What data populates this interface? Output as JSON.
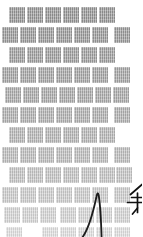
{
  "scene": {
    "description": "Scanned page fragment: fading halftone grid of gray squares, hand-drawn narrow peak curve, partial CJK character cut off at right edge",
    "background_color": "#ffffff"
  },
  "grid": {
    "square_size": 16,
    "row_pitch": 20,
    "rows": [
      {
        "y": 7,
        "shade": "#959595",
        "squares": [
          9,
          27,
          45,
          63,
          81,
          99
        ]
      },
      {
        "y": 27,
        "shade": "#999999",
        "squares": [
          2,
          20,
          38,
          56,
          74,
          92,
          114
        ]
      },
      {
        "y": 47,
        "shade": "#9e9e9e",
        "squares": [
          9,
          27,
          45,
          63,
          81,
          99
        ]
      },
      {
        "y": 67,
        "shade": "#a4a4a4",
        "squares": [
          2,
          20,
          38,
          56,
          74,
          92,
          114
        ]
      },
      {
        "y": 87,
        "shade": "#a9a9a9",
        "squares": [
          5,
          23,
          41,
          59,
          77,
          95,
          113
        ]
      },
      {
        "y": 107,
        "shade": "#afafaf",
        "squares": [
          2,
          20,
          38,
          56,
          74,
          92,
          114
        ]
      },
      {
        "y": 127,
        "shade": "#b6b6b6",
        "squares": [
          9,
          27,
          45,
          63,
          81,
          99
        ]
      },
      {
        "y": 147,
        "shade": "#bcbcbc",
        "squares": [
          2,
          20,
          38,
          56,
          74,
          92,
          114
        ]
      },
      {
        "y": 167,
        "shade": "#c4c4c4",
        "squares": [
          9,
          27,
          45,
          63,
          81,
          99,
          116
        ]
      },
      {
        "y": 187,
        "shade": "#cccccc",
        "squares": [
          2,
          20,
          38,
          56,
          74,
          92,
          114
        ]
      },
      {
        "y": 207,
        "shade": "#d5d5d5",
        "squares": [
          4,
          22,
          40,
          60,
          78,
          96,
          114
        ]
      },
      {
        "y": 227,
        "shade": "#e0e0e0",
        "squares": [
          6,
          42,
          60,
          78,
          96,
          114
        ]
      }
    ]
  },
  "curve": {
    "semantic": "narrow-peak-curve",
    "path": "M 82 238 C 88 230 93 213 96.4 197 C 97.2 192.6 98 192 98.8 196 C 100.2 205 101.1 221 101.6 238",
    "stroke": "#1c1c1c",
    "stroke_width": 1.8
  },
  "cjk_fragment": {
    "semantic": "partial-cjk-character-metal-radical",
    "strokes": [
      "M 142 184.5 L 130.5 194.5",
      "M 131.5 197.5 L 142 197.5",
      "M 127.5 202.5 L 142 202.5",
      "M 137.5 193 L 137.5 212.5",
      "M 132.5 214 L 137.5 208"
    ],
    "stroke": "#111111",
    "stroke_width": 1.7
  }
}
